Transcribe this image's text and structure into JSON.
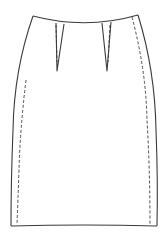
{
  "figure": {
    "title": "Pencil skirt technical flat sketch",
    "view": "front",
    "stroke_color": "#3a3a3a",
    "background": "#ffffff",
    "elements": [
      {
        "name": "waistline",
        "type": "solid"
      },
      {
        "name": "left-side-seam",
        "type": "solid"
      },
      {
        "name": "right-side-seam",
        "type": "solid"
      },
      {
        "name": "hemline",
        "type": "solid"
      },
      {
        "name": "left-dart",
        "type": "solid"
      },
      {
        "name": "right-dart",
        "type": "solid"
      },
      {
        "name": "left-dart-stitch",
        "type": "dashed"
      },
      {
        "name": "right-dart-stitch",
        "type": "dashed"
      },
      {
        "name": "left-topstitch",
        "type": "dashed"
      },
      {
        "name": "right-topstitch",
        "type": "dashed"
      }
    ]
  }
}
